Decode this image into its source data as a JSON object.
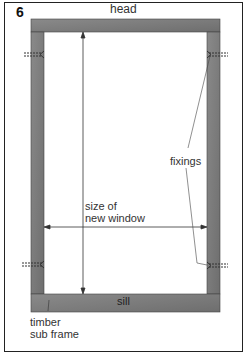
{
  "figure": {
    "number": "6"
  },
  "labels": {
    "head": "head",
    "sill": "sill",
    "fixings": "fixings",
    "size_line1": "size of",
    "size_line2": "new window",
    "timber_line1": "timber",
    "timber_line2": "sub frame"
  },
  "colors": {
    "frame": "#7a7a7a",
    "frame_dark": "#555555",
    "line": "#333333"
  }
}
